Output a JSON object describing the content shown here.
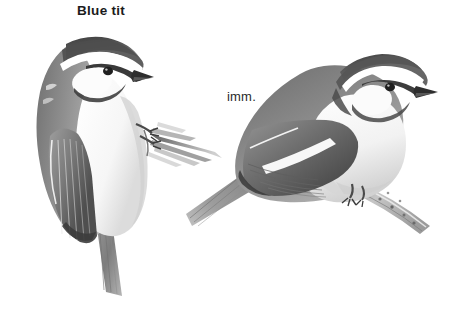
{
  "plate": {
    "width": 459,
    "height": 314,
    "background_color": "#ffffff",
    "medium": "grayscale pencil illustration",
    "species_title": "Blue tit",
    "immature_label": "imm."
  },
  "palette": {
    "background": "#ffffff",
    "ink_darkest": "#2b2b2b",
    "crown_dark": "#4a4a4a",
    "mantle_mid": "#8a8a8a",
    "wing_grey": "#757575",
    "wing_light": "#a8a8a8",
    "underpart_white": "#fbfbfb",
    "underpart_shadow": "#d8d8d8",
    "branch_grey": "#9a9a9a",
    "text": "#1b1b1b"
  },
  "figures": [
    {
      "id": "adult",
      "name": "blue-tit-adult",
      "label": "Blue tit",
      "pose": "upright perched, facing right",
      "bbox": [
        28,
        36,
        225,
        300
      ],
      "features": [
        "dark grey crown cap",
        "white nape collar",
        "white supercilium",
        "dark eyestripe through eye",
        "white cheek patch",
        "dark bib stripe",
        "short conical dark bill",
        "grey mantle and back",
        "folded wing with feather striations and pale edges",
        "white underparts",
        "long tail angled down and to the right",
        "feet gripping a thin twig"
      ]
    },
    {
      "id": "immature",
      "name": "blue-tit-immature",
      "label": "imm.",
      "pose": "horizontal perched on branch, facing right",
      "bbox": [
        186,
        52,
        450,
        232
      ],
      "features": [
        "dark crown cap",
        "white supercilium",
        "dark eyestripe",
        "pale cheek patch",
        "short dark bill",
        "grey mantle",
        "white wingbar across the folded wing",
        "primary feather striations",
        "pale washed underparts",
        "tail pointing down to the left",
        "perched on a speckled branch angled down-right"
      ]
    }
  ],
  "annotations": {
    "title_position": {
      "x": 77,
      "y": 3
    },
    "imm_position": {
      "x": 227,
      "y": 89
    }
  }
}
